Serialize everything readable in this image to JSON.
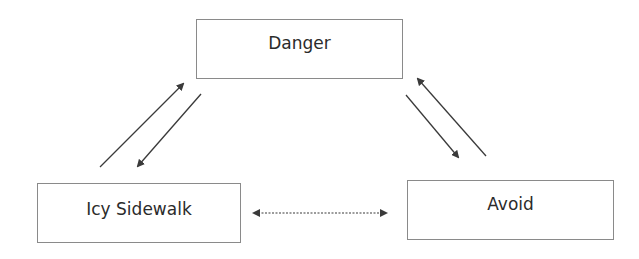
{
  "diagram": {
    "nodes": [
      {
        "id": "danger",
        "label": "Danger"
      },
      {
        "id": "icy_sidewalk",
        "label": "Icy Sidewalk"
      },
      {
        "id": "avoid",
        "label": "Avoid"
      }
    ],
    "edges": [
      {
        "from": "icy_sidewalk",
        "to": "danger",
        "style": "solid"
      },
      {
        "from": "danger",
        "to": "icy_sidewalk",
        "style": "solid"
      },
      {
        "from": "danger",
        "to": "avoid",
        "style": "solid"
      },
      {
        "from": "avoid",
        "to": "danger",
        "style": "solid"
      },
      {
        "from": "icy_sidewalk",
        "to": "avoid",
        "style": "dotted",
        "bidirectional": true
      }
    ],
    "colors": {
      "border": "#8a8a8a",
      "arrow": "#3a3a3a",
      "text": "#2b2b2b",
      "background": "#ffffff"
    }
  }
}
